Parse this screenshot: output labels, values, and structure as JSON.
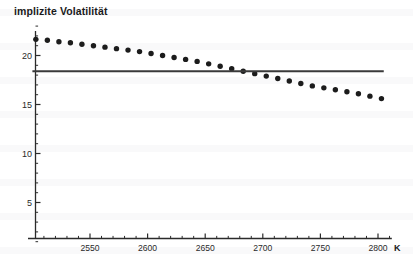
{
  "chart_data": {
    "type": "scatter",
    "title": "implizite Volatilität",
    "xlabel": "K",
    "ylabel": "",
    "xlim": [
      2500,
      2812
    ],
    "ylim": [
      0,
      23.5
    ],
    "grid": false,
    "legend": null,
    "xticks": [
      2550,
      2600,
      2650,
      2700,
      2750,
      2800
    ],
    "xtick_labels": [
      "2550",
      "2600",
      "2650",
      "2700",
      "2750",
      "2800"
    ],
    "xminor_step": 10,
    "yticks": [
      5,
      10,
      15,
      20
    ],
    "ytick_labels": [
      "5",
      "10",
      "15",
      "20"
    ],
    "yminor_step": 1,
    "series": [
      {
        "name": "implizite Volatilität (Smile)",
        "type": "scatter",
        "marker": "filled-circle",
        "color": "#1c1c1c",
        "x": [
          2503,
          2513,
          2523,
          2533,
          2543,
          2553,
          2563,
          2573,
          2583,
          2593,
          2603,
          2613,
          2623,
          2633,
          2643,
          2653,
          2663,
          2673,
          2683,
          2693,
          2703,
          2713,
          2723,
          2733,
          2743,
          2753,
          2763,
          2773,
          2783,
          2793,
          2803
        ],
        "y": [
          21.65,
          21.55,
          21.4,
          21.3,
          21.15,
          21.0,
          20.85,
          20.7,
          20.55,
          20.4,
          20.2,
          20.0,
          19.8,
          19.6,
          19.4,
          19.15,
          18.9,
          18.65,
          18.4,
          18.15,
          17.9,
          17.65,
          17.4,
          17.15,
          16.9,
          16.7,
          16.5,
          16.3,
          16.1,
          15.85,
          15.6
        ]
      },
      {
        "name": "konstante Volatilität (Referenzlinie)",
        "type": "line",
        "color": "#3a3a3a",
        "x": [
          2500,
          2805
        ],
        "y": [
          18.4,
          18.4
        ]
      }
    ],
    "annotations": []
  },
  "colors": {
    "marker": "#1c1c1c",
    "reference_line": "#3a3a3a",
    "axis": "#2b2b2b",
    "background": "#ffffff"
  }
}
